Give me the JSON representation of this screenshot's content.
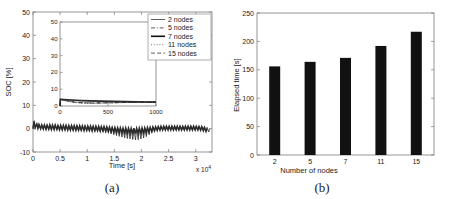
{
  "figure": {
    "panels": [
      {
        "caption": "(a)",
        "type": "line",
        "xlabel": "Time [s]",
        "ylabel": "SOC [%]",
        "x_exponent_label": "x 10",
        "x_exponent_sup": "4",
        "xlim": [
          0,
          33000
        ],
        "ylim": [
          -10,
          50
        ],
        "xticks": [
          0,
          5000,
          10000,
          15000,
          20000,
          25000,
          30000
        ],
        "xticklabels": [
          "0",
          "0.5",
          "1",
          "1.5",
          "2",
          "2.5",
          "3"
        ],
        "yticks": [
          -10,
          0,
          10,
          20,
          30,
          40,
          50
        ],
        "yticklabels": [
          "-10",
          "0",
          "10",
          "20",
          "30",
          "40",
          "50"
        ],
        "grid": false,
        "legend_position": "top-right",
        "legend": [
          {
            "label": "2 nodes",
            "style": "solid",
            "width": 0.8,
            "color": "#333333"
          },
          {
            "label": "5 nodes",
            "style": "dashdot",
            "width": 0.8,
            "color": "#333333"
          },
          {
            "label": "7 nodes",
            "style": "solid",
            "width": 1.6,
            "color": "#111111"
          },
          {
            "label": "11 nodes",
            "style": "dotted",
            "width": 0.8,
            "color": "#555555"
          },
          {
            "label": "15 nodes",
            "style": "dashed",
            "width": 0.8,
            "color": "#333333"
          }
        ],
        "inset": {
          "xlabel": "",
          "ylabel": "",
          "xlim": [
            0,
            1000
          ],
          "ylim": [
            0,
            50
          ],
          "xticks": [
            0,
            500,
            1000
          ],
          "xticklabels": [
            "0",
            "500",
            "1000"
          ],
          "yticks": [
            0,
            10,
            20,
            30,
            40,
            50
          ],
          "yticklabels": [
            "0",
            "10",
            "20",
            "30",
            "40",
            "50"
          ],
          "series": [
            {
              "name": "2 nodes",
              "style": "solid",
              "width": 0.8,
              "x": [
                0,
                5,
                40,
                120,
                220,
                330,
                440,
                560,
                680,
                800,
                900,
                1000
              ],
              "y": [
                0,
                4.0,
                3.8,
                3.4,
                3.0,
                2.8,
                2.7,
                2.6,
                2.5,
                2.4,
                2.35,
                2.3
              ]
            },
            {
              "name": "5 nodes",
              "style": "dashdot",
              "width": 0.8,
              "x": [
                0,
                5,
                40,
                120,
                220,
                330,
                440,
                560,
                680,
                800,
                900,
                1000
              ],
              "y": [
                0,
                4.0,
                3.5,
                2.6,
                2.0,
                1.8,
                1.9,
                2.0,
                2.1,
                2.2,
                2.25,
                2.3
              ]
            },
            {
              "name": "7 nodes",
              "style": "solid",
              "width": 1.6,
              "x": [
                0,
                5,
                40,
                120,
                220,
                330,
                440,
                560,
                680,
                800,
                900,
                1000
              ],
              "y": [
                0,
                4.0,
                3.9,
                3.6,
                3.3,
                3.1,
                2.9,
                2.8,
                2.6,
                2.5,
                2.4,
                2.3
              ]
            },
            {
              "name": "11 nodes",
              "style": "dotted",
              "width": 0.8,
              "x": [
                0,
                5,
                40,
                120,
                220,
                330,
                440,
                560,
                680,
                800,
                900,
                1000
              ],
              "y": [
                0,
                4.0,
                3.3,
                2.3,
                1.7,
                1.6,
                1.7,
                1.9,
                2.05,
                2.15,
                2.25,
                2.3
              ]
            },
            {
              "name": "15 nodes",
              "style": "dashed",
              "width": 0.8,
              "x": [
                0,
                5,
                40,
                120,
                220,
                330,
                440,
                560,
                680,
                800,
                900,
                1000
              ],
              "y": [
                0,
                4.0,
                3.4,
                2.5,
                1.9,
                1.75,
                1.85,
                1.95,
                2.1,
                2.2,
                2.25,
                2.3
              ]
            }
          ]
        },
        "main_series_description": "Sawtooth SOC error oscillating about 0% across the run; spikes up to ~3-4% at each cycle, step-down plateaus reaching about -5% between 1.3e4 s and 2.1e4 s.",
        "main_series": [
          {
            "name": "2 nodes",
            "style": "solid",
            "width": 0.8,
            "x": [
              0,
              200,
              400,
              700,
              900,
              1100,
              1400,
              1600,
              1900,
              2100,
              2400,
              2600,
              2900,
              3100,
              3400,
              3600,
              3900,
              4100,
              4400,
              4600,
              4900,
              5100,
              5400,
              5600,
              5900,
              6100,
              6400,
              6600,
              6900,
              7100,
              7400,
              7600,
              7900,
              8100,
              8400,
              8600,
              8900,
              9100,
              9400,
              9600,
              9900,
              10100,
              10400,
              10600,
              10900,
              11100,
              11400,
              11600,
              11900,
              12100,
              12400,
              12600,
              12900,
              13100,
              13400,
              13600,
              13900,
              14100,
              14400,
              14600,
              14900,
              15100,
              15400,
              15600,
              15900,
              16100,
              16400,
              16600,
              16900,
              17100,
              17400,
              17600,
              17900,
              18100,
              18400,
              18600,
              18900,
              19100,
              19400,
              19600,
              19900,
              20100,
              20400,
              20600,
              20900,
              21100,
              21400,
              21600,
              21900,
              22100,
              22400,
              22600,
              22900,
              23100,
              23400,
              23600,
              23900,
              24100,
              24400,
              24600,
              24900,
              25100,
              25400,
              25600,
              25900,
              26100,
              26400,
              26600,
              26900,
              27100,
              27400,
              27600,
              27900,
              28100,
              28400,
              28600,
              28900,
              29100,
              29400,
              29600,
              29900,
              30100,
              30400,
              30600,
              30900,
              31100,
              31400,
              31600,
              31900,
              32100,
              32400,
              32600,
              32900
            ],
            "y": [
              0,
              3.4,
              0.6,
              2.2,
              0.2,
              1.9,
              0.0,
              1.8,
              -0.2,
              1.7,
              -0.3,
              1.7,
              -0.3,
              1.8,
              -0.4,
              1.6,
              -0.4,
              1.7,
              -0.5,
              1.6,
              -0.5,
              1.6,
              -0.6,
              1.5,
              -0.6,
              1.6,
              -0.7,
              1.5,
              -0.7,
              1.5,
              -0.8,
              1.4,
              -0.8,
              1.4,
              -0.9,
              1.4,
              -0.9,
              1.3,
              -1.0,
              1.3,
              -1.0,
              1.3,
              -1.1,
              1.2,
              -1.1,
              1.2,
              -1.2,
              1.2,
              -1.2,
              1.1,
              -1.3,
              1.1,
              -1.4,
              1.0,
              -1.6,
              0.9,
              -1.9,
              0.7,
              -2.2,
              0.5,
              -2.6,
              0.3,
              -3.0,
              0.2,
              -3.3,
              0.1,
              -3.6,
              0.0,
              -3.9,
              -0.1,
              -4.2,
              -0.2,
              -4.4,
              -0.3,
              -4.6,
              -0.2,
              -4.8,
              -0.2,
              -4.7,
              -0.1,
              -4.4,
              0.0,
              -4.0,
              0.2,
              -3.4,
              0.4,
              -2.6,
              0.6,
              -1.8,
              0.8,
              -1.2,
              0.9,
              -0.8,
              1.0,
              -0.6,
              1.1,
              -0.5,
              1.1,
              -0.5,
              1.2,
              -0.5,
              1.2,
              -0.5,
              1.2,
              -0.5,
              1.2,
              -0.5,
              1.2,
              -0.5,
              1.2,
              -0.5,
              1.2,
              -0.5,
              1.2,
              -0.5,
              1.2,
              -0.5,
              1.2,
              -0.5,
              1.2,
              -0.5,
              1.2,
              -0.5,
              1.2,
              -0.5,
              1.1,
              -0.6,
              1.0,
              -0.8,
              0.6,
              -1.4,
              0.0
            ]
          },
          {
            "name": "7 nodes",
            "style": "solid",
            "width": 1.5,
            "x": [
              0,
              200,
              400,
              700,
              900,
              1100,
              1400,
              1600,
              1900,
              2100,
              2400,
              2600,
              2900,
              3100,
              3400,
              3600,
              3900,
              4100,
              4400,
              4600,
              4900,
              5100,
              5400,
              5600,
              5900,
              6100,
              6400,
              6600,
              6900,
              7100,
              7400,
              7600,
              7900,
              8100,
              8400,
              8600,
              8900,
              9100,
              9400,
              9600,
              9900,
              10100,
              10400,
              10600,
              10900,
              11100,
              11400,
              11600,
              11900,
              12100,
              12400,
              12600,
              12900,
              13100,
              13400,
              13600,
              13900,
              14100,
              14400,
              14600,
              14900,
              15100,
              15400,
              15600,
              15900,
              16100,
              16400,
              16600,
              16900,
              17100,
              17400,
              17600,
              17900,
              18100,
              18400,
              18600,
              18900,
              19100,
              19400,
              19600,
              19900,
              20100,
              20400,
              20600,
              20900,
              21100,
              21400,
              21600,
              21900,
              22100,
              22400,
              22600,
              22900,
              23100,
              23400,
              23600,
              23900,
              24100,
              24400,
              24600,
              24900,
              25100,
              25400,
              25600,
              25900,
              26100,
              26400,
              26600,
              26900,
              27100,
              27400,
              27600,
              27900,
              28100,
              28400,
              28600,
              28900,
              29100,
              29400,
              29600,
              29900,
              30100,
              30400,
              30600,
              30900,
              31100,
              31400,
              31600,
              31900,
              32100,
              32400,
              32600,
              32900
            ],
            "y": [
              0,
              3.0,
              0.4,
              2.0,
              0.1,
              1.8,
              -0.1,
              1.6,
              -0.2,
              1.6,
              -0.3,
              1.5,
              -0.3,
              1.6,
              -0.4,
              1.5,
              -0.4,
              1.5,
              -0.4,
              1.4,
              -0.5,
              1.4,
              -0.5,
              1.4,
              -0.5,
              1.4,
              -0.6,
              1.3,
              -0.6,
              1.3,
              -0.6,
              1.3,
              -0.7,
              1.2,
              -0.7,
              1.2,
              -0.7,
              1.2,
              -0.8,
              1.1,
              -0.8,
              1.1,
              -0.8,
              1.1,
              -0.9,
              1.0,
              -0.9,
              1.0,
              -0.9,
              1.0,
              -1.0,
              0.9,
              -1.0,
              0.9,
              -1.1,
              0.8,
              -1.2,
              0.7,
              -1.3,
              0.6,
              -1.4,
              0.5,
              -1.5,
              0.4,
              -1.6,
              0.4,
              -1.7,
              0.3,
              -1.8,
              0.3,
              -1.9,
              0.2,
              -2.0,
              0.2,
              -2.0,
              0.2,
              -2.1,
              0.2,
              -2.0,
              0.3,
              -1.9,
              0.3,
              -1.8,
              0.4,
              -1.6,
              0.5,
              -1.4,
              0.6,
              -1.2,
              0.7,
              -1.0,
              0.8,
              -0.8,
              0.9,
              -0.7,
              1.0,
              -0.6,
              1.0,
              -0.6,
              1.0,
              -0.6,
              1.0,
              -0.6,
              1.0,
              -0.6,
              1.0,
              -0.6,
              1.0,
              -0.6,
              1.0,
              -0.6,
              1.0,
              -0.6,
              1.0,
              -0.6,
              1.0,
              -0.6,
              1.0,
              -0.6,
              1.0,
              -0.6,
              1.0,
              -0.6,
              0.9,
              -0.7,
              0.8,
              -0.9,
              0.5,
              -1.3,
              0.0
            ]
          }
        ]
      },
      {
        "caption": "(b)",
        "type": "bar",
        "xlabel": "Number of nodes",
        "ylabel": "Elapsed time [s]",
        "categories": [
          "2",
          "5",
          "7",
          "11",
          "15"
        ],
        "values": [
          156,
          164,
          171,
          192,
          217
        ],
        "ylim": [
          0,
          250
        ],
        "yticks": [
          0,
          50,
          100,
          150,
          200,
          250
        ],
        "yticklabels": [
          "0",
          "50",
          "100",
          "150",
          "200",
          "250"
        ],
        "grid": false,
        "bar_color": "#111111"
      }
    ]
  }
}
